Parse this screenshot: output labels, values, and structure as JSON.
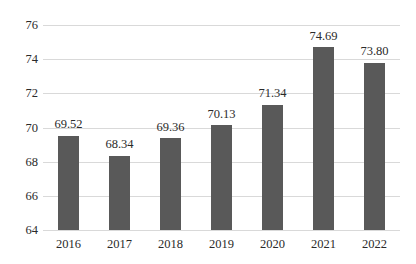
{
  "chart_data": {
    "type": "bar",
    "title": "",
    "subtitle": "",
    "xlabel": "",
    "ylabel": "",
    "categories": [
      "2016",
      "2017",
      "2018",
      "2019",
      "2020",
      "2021",
      "2022"
    ],
    "values": [
      69.52,
      68.34,
      69.36,
      70.13,
      71.34,
      74.69,
      73.8
    ],
    "data_labels": [
      "69.52",
      "68.34",
      "69.36",
      "70.13",
      "71.34",
      "74.69",
      "73.80"
    ],
    "ylim": [
      64,
      76
    ],
    "yticks": [
      64,
      66,
      68,
      70,
      72,
      74,
      76
    ],
    "ytick_labels": [
      "64",
      "66",
      "68",
      "70",
      "72",
      "74",
      "76"
    ],
    "grid": true,
    "grid_axis": "y",
    "legend": false,
    "legend_position": "none",
    "annotations": [],
    "series": [
      {
        "name": "",
        "values": [
          69.52,
          68.34,
          69.36,
          70.13,
          71.34,
          74.69,
          73.8
        ],
        "color": "#595959"
      }
    ],
    "colors": {
      "bar": "#595959",
      "gridline": "#d9d9d9",
      "text": "#2a2a2a",
      "background": "#ffffff"
    }
  }
}
